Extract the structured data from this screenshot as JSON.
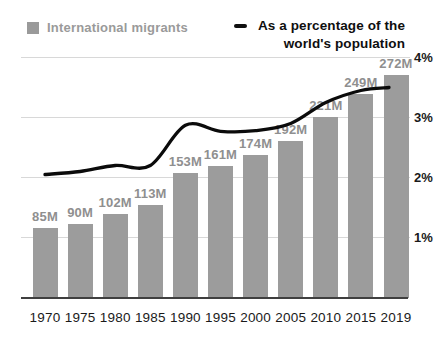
{
  "legend": {
    "bars": {
      "label": "International migrants",
      "swatch_color": "#9a9a9a"
    },
    "line": {
      "dash": "—",
      "label_line1": "As a percentage of the",
      "label_line2": "world's population"
    }
  },
  "chart_data": {
    "type": "bar+line combo",
    "categories": [
      "1970",
      "1975",
      "1980",
      "1985",
      "1990",
      "1995",
      "2000",
      "2005",
      "2010",
      "2015",
      "2019"
    ],
    "series": [
      {
        "name": "International migrants",
        "type": "bar",
        "unit": "millions",
        "values": [
          85,
          90,
          102,
          113,
          153,
          161,
          174,
          192,
          221,
          249,
          272
        ],
        "value_labels": [
          "85M",
          "90M",
          "102M",
          "113M",
          "153M",
          "161M",
          "174M",
          "192M",
          "221M",
          "249M",
          "272M"
        ]
      },
      {
        "name": "As a percentage of the world's population",
        "type": "line",
        "unit": "percent",
        "axis": "right",
        "values": [
          2.05,
          2.1,
          2.2,
          2.2,
          2.87,
          2.77,
          2.78,
          2.9,
          3.25,
          3.45,
          3.5
        ]
      }
    ],
    "y_right": {
      "ticks": [
        "1%",
        "2%",
        "3%",
        "4%"
      ],
      "tick_values": [
        1,
        2,
        3,
        4
      ],
      "range": [
        0,
        4
      ]
    },
    "grid": true,
    "legend_position": "top"
  },
  "colors": {
    "bar": "#9c9c9c",
    "bar_label": "#8f8f8f",
    "legend_gray": "#9a9a9a",
    "line": "#0b0b0b",
    "gridline": "#d8d8d8",
    "axis_line": "#3f3f3f",
    "tick_label": "#1a1a1a"
  }
}
